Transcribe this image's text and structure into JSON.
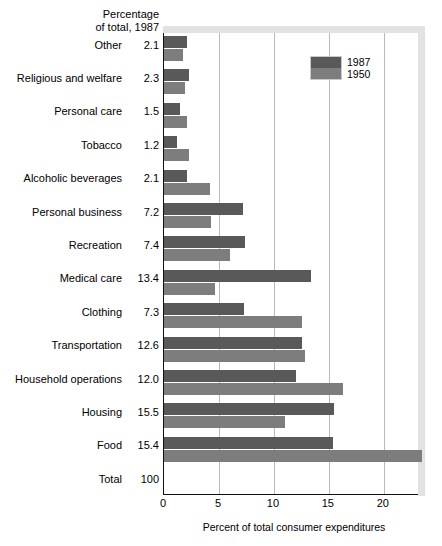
{
  "header": {
    "line1": "Percentage",
    "line2": "of total, 1987"
  },
  "legend": {
    "position": "top-right",
    "entries": [
      {
        "label": "1987",
        "color": "#595959"
      },
      {
        "label": "1950",
        "color": "#7d7d7d"
      }
    ]
  },
  "axis": {
    "x_title": "Percent of total consumer expenditures",
    "ticks": [
      "0",
      "5",
      "10",
      "15",
      "20"
    ]
  },
  "chart_data": {
    "type": "bar",
    "orientation": "horizontal",
    "title": "",
    "subtitle": "",
    "xlabel": "Percent of total consumer expenditures",
    "ylabel": "",
    "xlim": [
      0,
      23.2
    ],
    "grid": true,
    "legend_position": "top-right",
    "categories": [
      "Other",
      "Religious and welfare",
      "Personal care",
      "Tobacco",
      "Alcoholic beverages",
      "Personal business",
      "Recreation",
      "Medical care",
      "Clothing",
      "Transportation",
      "Household operations",
      "Housing",
      "Food",
      "Total"
    ],
    "percentage_of_total_1987": [
      "2.1",
      "2.3",
      "1.5",
      "1.2",
      "2.1",
      "7.2",
      "7.4",
      "13.4",
      "7.3",
      "12.6",
      "12.0",
      "15.5",
      "15.4",
      "100"
    ],
    "series": [
      {
        "name": "1987",
        "color": "#595959",
        "values": [
          2.1,
          2.3,
          1.5,
          1.2,
          2.1,
          7.2,
          7.4,
          13.4,
          7.3,
          12.6,
          12.0,
          15.5,
          15.4,
          null
        ]
      },
      {
        "name": "1950",
        "color": "#7d7d7d",
        "values": [
          1.7,
          1.9,
          2.1,
          2.3,
          4.2,
          4.3,
          6.0,
          4.6,
          12.6,
          12.8,
          16.3,
          11.0,
          23.5,
          null
        ]
      }
    ],
    "ticks": [
      0,
      5,
      10,
      15,
      20
    ]
  }
}
